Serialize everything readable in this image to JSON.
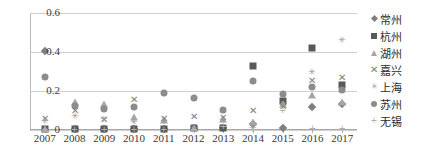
{
  "chart_data": {
    "type": "scatter",
    "title": "",
    "xlabel": "",
    "ylabel": "",
    "ylim": [
      0,
      0.6
    ],
    "yticks": [
      "0",
      "0.2",
      "0.4",
      "0.6"
    ],
    "ytick_values": [
      0,
      0.2,
      0.4,
      0.6
    ],
    "grid": "horizontal",
    "legend_position": "right",
    "categories": [
      "2007",
      "2008",
      "2009",
      "2010",
      "2011",
      "2012",
      "2013",
      "2014",
      "2015",
      "2016",
      "2017"
    ],
    "series": [
      {
        "name": "常州",
        "marker": "diamond",
        "color": "#7f7f7f",
        "values": [
          0.405,
          0.005,
          0.005,
          0.005,
          0.005,
          0.008,
          0.008,
          0.03,
          0.01,
          0.12,
          0.135
        ]
      },
      {
        "name": "杭州",
        "marker": "square",
        "color": "#595959",
        "values": [
          0.005,
          0.005,
          0.005,
          0.005,
          0.005,
          0.008,
          0.008,
          0.33,
          0.15,
          0.42,
          0.23
        ]
      },
      {
        "name": "湖州",
        "marker": "triangle",
        "color": "#a6a6a6",
        "values": [
          0.003,
          0.145,
          0.135,
          0.065,
          0.05,
          0.01,
          0.055,
          0.04,
          0.135,
          0.18,
          0.145
        ]
      },
      {
        "name": "嘉兴",
        "marker": "x",
        "color": "#808080",
        "values": [
          0.055,
          0.1,
          0.05,
          0.155,
          0.055,
          0.065,
          0.06,
          0.1,
          0.12,
          0.25,
          0.265
        ]
      },
      {
        "name": "上海",
        "marker": "star",
        "color": "#9a9a9a",
        "values": [
          0.045,
          0.07,
          0.055,
          0.04,
          0.045,
          0.008,
          0.05,
          0.01,
          0.135,
          0.295,
          0.46
        ]
      },
      {
        "name": "苏州",
        "marker": "circle",
        "color": "#8c8c8c",
        "values": [
          0.27,
          0.125,
          0.11,
          0.12,
          0.19,
          0.165,
          0.105,
          0.25,
          0.185,
          0.22,
          0.205
        ]
      },
      {
        "name": "无锡",
        "marker": "plus",
        "color": "#b0b0b0",
        "values": [
          0.005,
          0.005,
          0.005,
          0.005,
          0.005,
          0.006,
          0.02,
          0.005,
          0.105,
          0.008,
          0.01
        ]
      }
    ]
  },
  "legend": {
    "items": [
      {
        "label": "常州"
      },
      {
        "label": "杭州"
      },
      {
        "label": "湖州"
      },
      {
        "label": "嘉兴"
      },
      {
        "label": "上海"
      },
      {
        "label": "苏州"
      },
      {
        "label": "无锡"
      }
    ]
  }
}
